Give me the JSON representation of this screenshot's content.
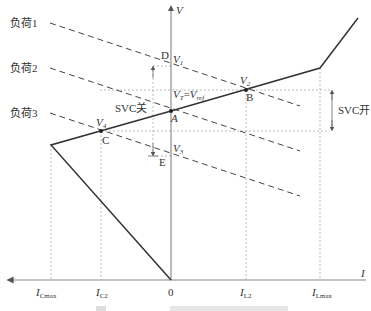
{
  "diagram": {
    "title_caption": "图 ... SVC的伏安特性 (partially visible, clipped)",
    "axes": {
      "v_axis_label": "V",
      "i_axis_label": "I",
      "origin_label": "0"
    },
    "load_lines": [
      {
        "label": "负荷1"
      },
      {
        "label": "负荷2"
      },
      {
        "label": "负荷3"
      }
    ],
    "points": {
      "A": "A",
      "B": "B",
      "C": "C",
      "D": "D",
      "E": "E"
    },
    "voltage_labels": {
      "v1": "V",
      "v1_sub": "1",
      "v2": "V",
      "v2_sub": "2",
      "v3": "V",
      "v3_sub": "3",
      "v4": "V",
      "v4_sub": "4",
      "vt": "V",
      "vt_sub": "T",
      "eq": "=",
      "vref": "V",
      "vref_sub": "ref"
    },
    "current_ticks": {
      "icmax": "I",
      "icmax_sub": "Cmax",
      "ic2": "I",
      "ic2_sub": "C2",
      "zero": "0",
      "il2": "I",
      "il2_sub": "L2",
      "ilmax": "I",
      "ilmax_sub": "Lmax"
    },
    "annotations": {
      "svc_off": "SVC关",
      "svc_on": "SVC开"
    }
  }
}
